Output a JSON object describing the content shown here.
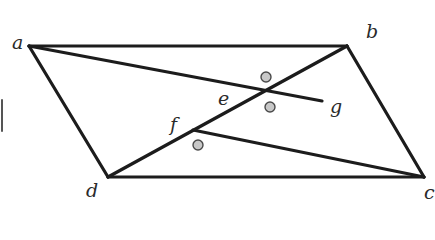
{
  "diagram": {
    "type": "geometry-figure",
    "colors": {
      "stroke": "#1c1c1c",
      "dot_fill": "#c8c8c8",
      "dot_stroke": "#4a4a4a",
      "label": "#2a2a2a",
      "background": "#ffffff"
    },
    "points": {
      "a": {
        "label": "a",
        "x": 29,
        "y": 46
      },
      "b": {
        "label": "b",
        "x": 347,
        "y": 46
      },
      "c": {
        "label": "c",
        "x": 424,
        "y": 177
      },
      "d": {
        "label": "d",
        "x": 108,
        "y": 177
      },
      "e": {
        "label": "e",
        "x": 264,
        "y": 92
      },
      "f": {
        "label": "f",
        "x": 193,
        "y": 130
      },
      "g": {
        "label": "g",
        "x": 322,
        "y": 101
      }
    },
    "segments": [
      {
        "from": "a",
        "to": "b"
      },
      {
        "from": "b",
        "to": "c"
      },
      {
        "from": "c",
        "to": "d"
      },
      {
        "from": "d",
        "to": "a"
      },
      {
        "from": "d",
        "to": "b"
      },
      {
        "from": "a",
        "to": "g"
      },
      {
        "from": "f",
        "to": "c"
      }
    ],
    "angle_markers": [
      {
        "name": "angle-above-e",
        "x": 266,
        "y": 77
      },
      {
        "name": "angle-below-e",
        "x": 270,
        "y": 107
      },
      {
        "name": "angle-below-f",
        "x": 198,
        "y": 145
      }
    ],
    "labels": [
      {
        "id": "a",
        "text": "a",
        "x": 12,
        "y": 33
      },
      {
        "id": "b",
        "text": "b",
        "x": 366,
        "y": 22
      },
      {
        "id": "c",
        "text": "c",
        "x": 424,
        "y": 183
      },
      {
        "id": "d",
        "text": "d",
        "x": 86,
        "y": 181
      },
      {
        "id": "e",
        "text": "e",
        "x": 218,
        "y": 89
      },
      {
        "id": "f",
        "text": "f",
        "x": 170,
        "y": 115
      },
      {
        "id": "g",
        "text": "g",
        "x": 330,
        "y": 97
      }
    ]
  }
}
